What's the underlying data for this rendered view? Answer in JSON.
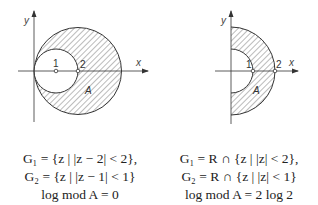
{
  "left_figure": {
    "axis_x_label": "x",
    "axis_y_label": "y",
    "point_labels": [
      "1",
      "2"
    ],
    "region_label": "A",
    "description": "Crescent region between circles |z-2|<2 and |z-1|<1, shaded",
    "caption": {
      "line1": "G₁ = {z | |z − 2| < 2},",
      "line2": "G₂ = {z | |z − 1| < 1}",
      "line3": "log mod A = 0"
    }
  },
  "right_figure": {
    "axis_x_label": "x",
    "axis_y_label": "y",
    "point_labels": [
      "1",
      "2"
    ],
    "region_label": "A",
    "description": "Half annulus 1<|z|<2 in right half-plane R, shaded",
    "caption": {
      "line1": "G₁ = R ∩ {z | |z| < 2},",
      "line2": "G₂ = R ∩ {z | |z| < 1}",
      "line3": "log mod A = 2 log 2"
    }
  }
}
